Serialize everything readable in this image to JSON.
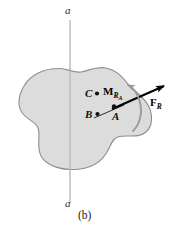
{
  "figure": {
    "caption": "(b)",
    "axis_label_top": "a",
    "axis_label_bottom": "a",
    "points": [
      {
        "id": "C",
        "label": "C",
        "x": 88,
        "y": 94
      },
      {
        "id": "B",
        "label": "B",
        "x": 89,
        "y": 114
      },
      {
        "id": "A",
        "label": "A",
        "x": 118,
        "y": 111
      }
    ],
    "vectors": [
      {
        "id": "resultant-force",
        "symbol": "F",
        "subscript": "R",
        "label": "F_R",
        "kind": "force",
        "tail": [
          95,
          120
        ],
        "head": [
          167,
          84
        ]
      },
      {
        "id": "resultant-couple-moment",
        "symbol": "M",
        "subscript": "R",
        "subsubscript": "A",
        "label": "M_RA",
        "kind": "couple-moment",
        "sense": "counterclockwise"
      }
    ],
    "colors": {
      "body_fill": "#dcdcdc",
      "body_stroke": "#8a8a8a",
      "axis_line": "#b0b0b0",
      "force_vector": "#000000",
      "moment_arc": "#9a9a9a",
      "background": "#ffffff",
      "text": "#111111"
    }
  }
}
